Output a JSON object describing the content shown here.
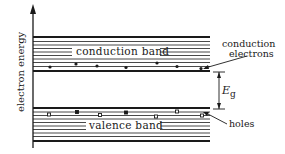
{
  "diagram": {
    "axis_label": "electron energy",
    "conduction_band_label": "conduction band",
    "valence_band_label": "valence band",
    "conduction_electrons_label_line1": "conduction",
    "conduction_electrons_label_line2": "electrons",
    "holes_label": "holes",
    "gap_label_main": "E",
    "gap_label_sub": "g",
    "colors": {
      "ink": "#1a1a1a",
      "background": "#ffffff"
    },
    "conduction_electrons_x": [
      50,
      76,
      97,
      126,
      157,
      177,
      201
    ],
    "holes_x": [
      49,
      77,
      100,
      126,
      156,
      177,
      202
    ]
  }
}
